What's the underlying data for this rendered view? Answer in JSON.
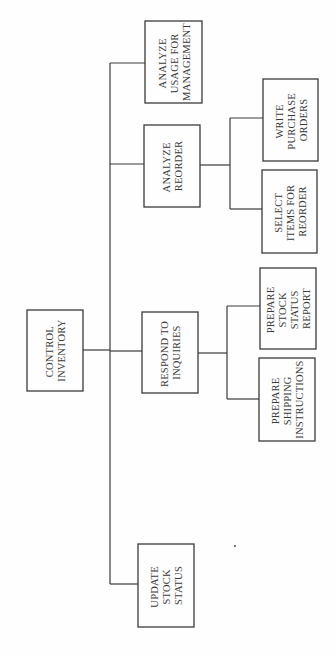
{
  "diagram": {
    "type": "hierarchy-chart",
    "orientation": "rotated-90-ccw",
    "root": {
      "id": "control-inventory",
      "lines": [
        "CONTROL",
        "INVENTORY"
      ]
    },
    "children": [
      {
        "id": "analyze-usage",
        "lines": [
          "ANALYZE",
          "USAGE FOR",
          "MANAGEMENT"
        ],
        "children": []
      },
      {
        "id": "analyze-reorder",
        "lines": [
          "ANALYZE",
          "REORDER"
        ],
        "children": [
          {
            "id": "write-purchase-orders",
            "lines": [
              "WRITE",
              "PURCHASE",
              "ORDERS"
            ]
          },
          {
            "id": "select-items-for-reorder",
            "lines": [
              "SELECT",
              "ITEMS FOR",
              "REORDER"
            ]
          }
        ]
      },
      {
        "id": "respond-to-inquiries",
        "lines": [
          "RESPOND TO",
          "INQUIRIES"
        ],
        "children": [
          {
            "id": "prepare-stock-status-report",
            "lines": [
              "PREPARE",
              "STOCK",
              "STATUS",
              "REPORT"
            ]
          },
          {
            "id": "prepare-shipping-instructions",
            "lines": [
              "PREPARE",
              "SHIPPING",
              "INSTRUCTIONS"
            ]
          }
        ]
      },
      {
        "id": "update-stock-status",
        "lines": [
          "UPDATE",
          "STOCK",
          "STATUS"
        ],
        "children": []
      }
    ]
  }
}
